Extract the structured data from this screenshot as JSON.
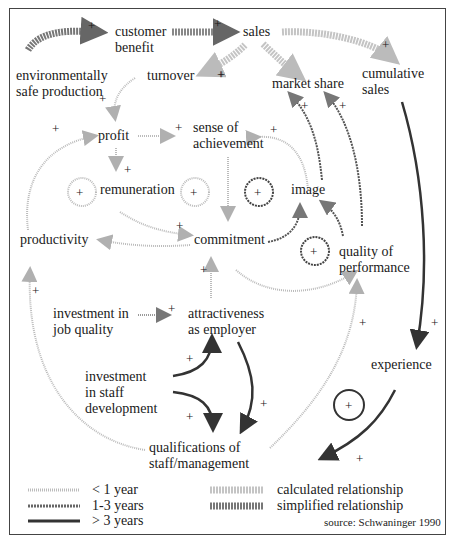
{
  "diagram": {
    "type": "causal-loop",
    "nodes": {
      "customer_benefit": "customer\nbenefit",
      "sales": "sales",
      "environmentally_safe_production": "environmentally\nsafe production",
      "turnover": "turnover",
      "market_share": "market share",
      "cumulative_sales": "cumulative\nsales",
      "profit": "profit",
      "sense_of_achievement": "sense of\nachievement",
      "remuneration": "remuneration",
      "image": "image",
      "productivity": "productivity",
      "commitment": "commitment",
      "quality_of_performance": "quality of\nperformance",
      "investment_in_job_quality": "investment in\njob quality",
      "attractiveness_as_employer": "attractiveness\nas employer",
      "experience": "experience",
      "investment_in_staff_development": "investment\nin staff\ndevelopment",
      "qualifications": "qualifications of\nstaff/management"
    },
    "polarity_sign": "+",
    "loop_sign": "+"
  },
  "legend": {
    "delays": [
      {
        "label": "< 1 year",
        "style": "light-dotted"
      },
      {
        "label": "1-3 years",
        "style": "medium"
      },
      {
        "label": "> 3 years",
        "style": "dark"
      }
    ],
    "relationships": [
      {
        "label": "calculated relationship",
        "style": "light-hatched"
      },
      {
        "label": "simplified relationship",
        "style": "dark-hatched"
      }
    ],
    "source": "source: Schwaninger 1990"
  },
  "colors": {
    "light": "#b8b8b8",
    "medium": "#777777",
    "dark": "#333333",
    "frame": "#444444"
  }
}
